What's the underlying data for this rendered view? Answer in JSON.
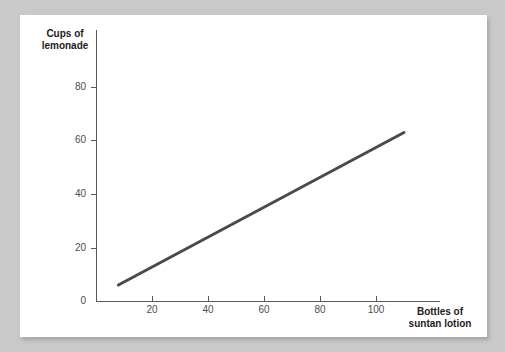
{
  "page": {
    "background_color": "#c9c9c9",
    "card_color": "#ffffff"
  },
  "chart_data": {
    "type": "line",
    "title": "",
    "subtitle": "",
    "xlabel": "Bottles of suntan lotion",
    "ylabel": "Cups of lemonade",
    "xlabel_lines": [
      "Bottles of",
      "suntan lotion"
    ],
    "ylabel_lines": [
      "Cups of",
      "lemonade"
    ],
    "xlim": [
      0,
      123
    ],
    "ylim": [
      0,
      101
    ],
    "xticks": [
      20,
      40,
      60,
      80,
      100
    ],
    "xtick_labels": [
      "20",
      "40",
      "60",
      "80",
      "100"
    ],
    "yticks": [
      0,
      20,
      40,
      60,
      80
    ],
    "ytick_labels": [
      "0",
      "20",
      "40",
      "60",
      "80"
    ],
    "grid": false,
    "legend": null,
    "series": [
      {
        "name": "Lemonade vs suntan lotion",
        "color": "#4a4a4a",
        "line_width": 3,
        "x": [
          8,
          110
        ],
        "values": [
          6,
          63
        ]
      }
    ],
    "annotations": []
  }
}
